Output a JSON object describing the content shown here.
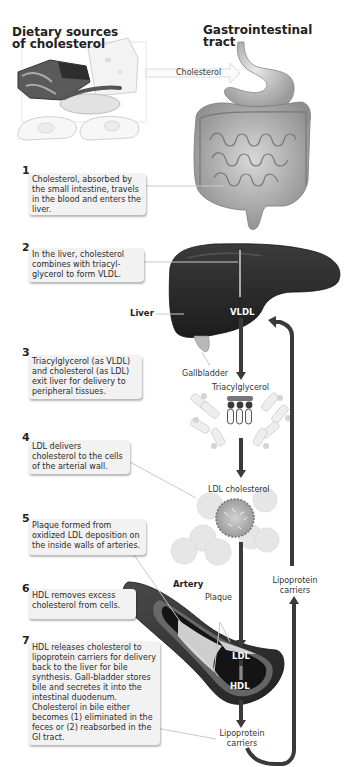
{
  "headings": {
    "dietary": "Dietary sources\nof cholesterol",
    "dietary_line1": "Dietary sources",
    "dietary_line2": "of cholesterol",
    "gi_line1": "Gastrointestinal",
    "gi_line2": "tract"
  },
  "arrow_labels": {
    "cholesterol": "Cholesterol"
  },
  "organ_labels": {
    "liver": "Liver",
    "vldl": "VLDL",
    "gallbladder": "Gallbladder",
    "triacylglycerol": "Triacylglycerol",
    "ldl_cholesterol": "LDL cholesterol",
    "artery": "Artery",
    "plaque": "Plaque",
    "ldl": "LDL",
    "hdl": "HDL",
    "lipoprotein_carriers_top_1": "Lipoprotein",
    "lipoprotein_carriers_top_2": "carriers",
    "lipoprotein_carriers_bottom_1": "Lipoprotein",
    "lipoprotein_carriers_bottom_2": "carriers"
  },
  "steps": [
    {
      "number": "1",
      "text": "Cholesterol, absorbed by the small intestine, travels in the blood and enters the liver."
    },
    {
      "number": "2",
      "text": "In the liver, cholesterol combines with triacyl-glycerol to form VLDL."
    },
    {
      "number": "3",
      "text": "Triacylglycerol (as VLDL) and cholesterol (as LDL) exit liver for delivery to peripheral tissues."
    },
    {
      "number": "4",
      "text": "LDL delivers cholesterol to the cells of the arterial wall."
    },
    {
      "number": "5",
      "text": "Plaque formed from oxidized LDL deposition on the inside walls of arteries."
    },
    {
      "number": "6",
      "text": "HDL removes excess cholesterol from cells."
    },
    {
      "number": "7",
      "text": "HDL releases cholesterol to lipoprotein carriers for delivery back to the liver for bile synthesis.  Gall-bladder stores bile and secretes it into the intestinal duodenum.  Cholesterol in bile either becomes (1) eliminated in the feces or (2) reabsorbed in the GI tract."
    }
  ],
  "colors": {
    "dark_organ": "#2a2a2a",
    "arrow": "#3a3a3a",
    "callout_bg": "#f2f2f2",
    "light_gray": "#d9d9d9"
  }
}
